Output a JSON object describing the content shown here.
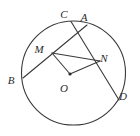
{
  "figure": {
    "type": "circle-geometry-diagram",
    "canvas": {
      "width": 140,
      "height": 136
    },
    "style": {
      "stroke_color": "#3a3a3a",
      "label_color": "#2b2b2b",
      "background_color": "#ffffff",
      "stroke_width": 1.1
    },
    "circle": {
      "name": "main-circle",
      "center": {
        "x": 73.5,
        "y": 73
      },
      "radius": 52
    },
    "center_dot": {
      "name": "center-point-dot",
      "x": 70,
      "y": 74,
      "radius": 1.6
    },
    "points": [
      {
        "id": "B",
        "label": "B",
        "x": 23,
        "y": 78,
        "label_x": 11,
        "label_y": 81,
        "on_circle": true
      },
      {
        "id": "C",
        "label": "C",
        "x": 71,
        "y": 21.5,
        "label_x": 64,
        "label_y": 15,
        "on_circle": true
      },
      {
        "id": "A",
        "label": "A",
        "x": 87,
        "y": 25,
        "label_x": 84,
        "label_y": 18,
        "on_circle": true
      },
      {
        "id": "D",
        "label": "D",
        "x": 119,
        "y": 100,
        "label_x": 123,
        "label_y": 97,
        "on_circle": true
      },
      {
        "id": "M",
        "label": "M",
        "x": 52,
        "y": 53,
        "label_x": 39,
        "label_y": 50,
        "on_circle": false
      },
      {
        "id": "N",
        "label": "N",
        "x": 100,
        "y": 61,
        "label_x": 104,
        "label_y": 59,
        "on_circle": false
      },
      {
        "id": "O",
        "label": "O",
        "x": 70,
        "y": 74,
        "label_x": 64,
        "label_y": 89,
        "on_circle": false
      }
    ],
    "segments": [
      {
        "name": "chord-B-A",
        "from": "B",
        "to": "A",
        "kind": "chord"
      },
      {
        "name": "chord-C-D",
        "from": "C",
        "to": "D",
        "kind": "chord"
      },
      {
        "name": "radius-O-M",
        "from": "O",
        "to": "M",
        "kind": "radius"
      },
      {
        "name": "radius-O-N",
        "from": "O",
        "to": "N",
        "kind": "radius"
      },
      {
        "name": "segment-M-N",
        "from": "M",
        "to": "N",
        "kind": "segment"
      }
    ]
  }
}
